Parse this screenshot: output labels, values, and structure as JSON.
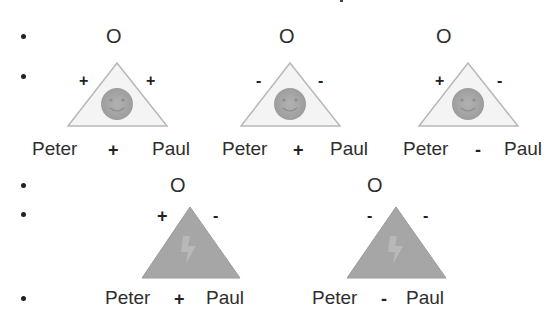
{
  "slide": {
    "title_fragment": "…",
    "bullets": 5
  },
  "rows": [
    {
      "type": "balanced",
      "triangles": [
        {
          "top_node": "O",
          "left_edge_sign": "+",
          "right_edge_sign": "+",
          "left_node": "Peter",
          "bottom_sign": "+",
          "right_node": "Paul",
          "center_icon": "smiley-face-icon"
        },
        {
          "top_node": "O",
          "left_edge_sign": "-",
          "right_edge_sign": "-",
          "left_node": "Peter",
          "bottom_sign": "+",
          "right_node": "Paul",
          "center_icon": "smiley-face-icon"
        },
        {
          "top_node": "O",
          "left_edge_sign": "+",
          "right_edge_sign": "-",
          "left_node": "Peter",
          "bottom_sign": "-",
          "right_node": "Paul",
          "center_icon": "smiley-face-icon"
        }
      ]
    },
    {
      "type": "unbalanced",
      "triangles": [
        {
          "top_node": "O",
          "left_edge_sign": "+",
          "right_edge_sign": "-",
          "left_node": "Peter",
          "bottom_sign": "+",
          "right_node": "Paul",
          "center_icon": "lightning-bolt-icon"
        },
        {
          "top_node": "O",
          "left_edge_sign": "-",
          "right_edge_sign": "-",
          "left_node": "Peter",
          "bottom_sign": "-",
          "right_node": "Paul",
          "center_icon": "lightning-bolt-icon"
        }
      ]
    }
  ],
  "colors": {
    "balanced_fill": "#f4f4f4",
    "balanced_stroke": "#b8b8b8",
    "face_fill": "#a9a9a9",
    "unbalanced_fill": "#a6a6a6",
    "text": "#2e2e2e"
  }
}
